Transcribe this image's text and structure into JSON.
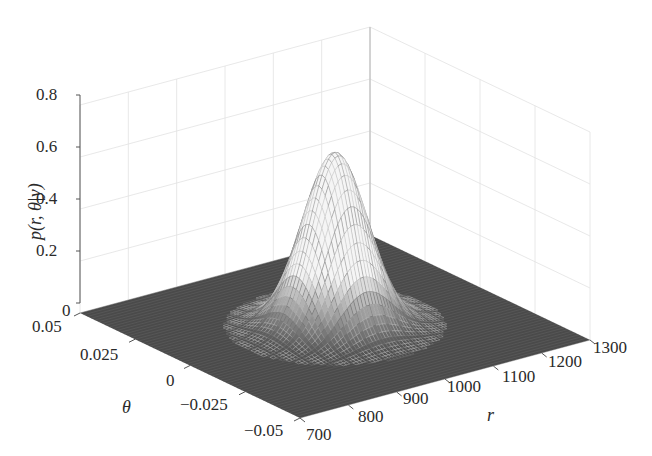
{
  "chart_data": {
    "type": "surface3d",
    "title": "",
    "zlabel": "p(r, θ|y)",
    "xlabel": "r",
    "ylabel": "θ",
    "z_ticks": [
      "0",
      "0.2",
      "0.4",
      "0.6",
      "0.8"
    ],
    "r_ticks": [
      "700",
      "800",
      "900",
      "1000",
      "1100",
      "1200",
      "1300"
    ],
    "theta_ticks": [
      "−0.05",
      "−0.025",
      "0",
      "0.025",
      "0.05"
    ],
    "zlim": [
      0,
      0.8
    ],
    "rlim": [
      700,
      1300
    ],
    "thetalim": [
      -0.05,
      0.05
    ],
    "grid": true,
    "surface": {
      "kind": "gaussian-like peak (mesh)",
      "peak_r": 1000,
      "peak_theta": 0.0,
      "peak_value": 0.67,
      "sigma_r": 55,
      "sigma_theta": 0.009,
      "base_value": 0
    }
  }
}
